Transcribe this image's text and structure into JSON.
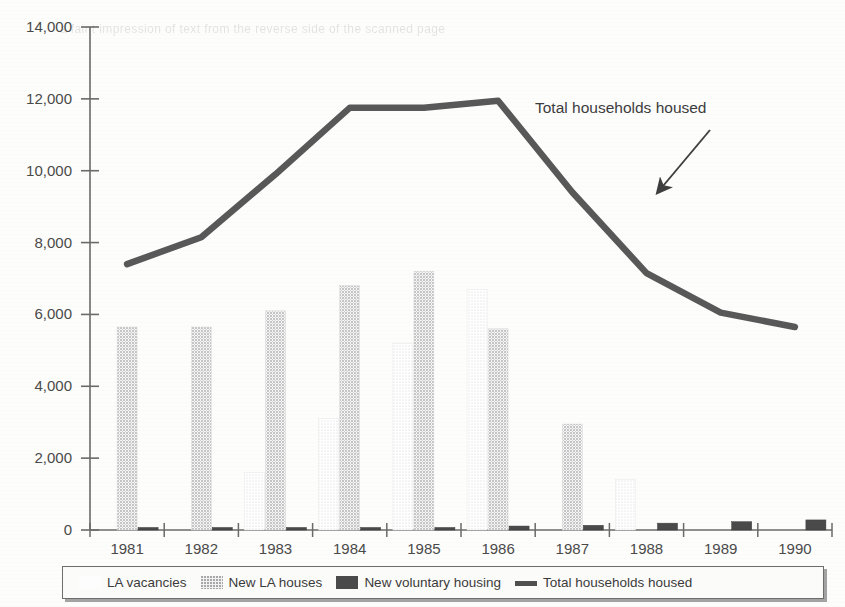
{
  "chart_data": {
    "type": "bar",
    "title": "",
    "subtitle": "",
    "xlabel": "",
    "ylabel": "",
    "ylim": [
      0,
      14000
    ],
    "ytick_values": [
      0,
      2000,
      4000,
      6000,
      8000,
      10000,
      12000,
      14000
    ],
    "ytick_labels": [
      "0",
      "2,000",
      "4,000",
      "6,000",
      "8,000",
      "10,000",
      "12,000",
      "14,000"
    ],
    "grid": false,
    "legend_position": "bottom",
    "categories": [
      "1981",
      "1982",
      "1983",
      "1984",
      "1985",
      "1986",
      "1987",
      "1988",
      "1989",
      "1990"
    ],
    "series": [
      {
        "name": "LA vacancies",
        "type": "bar",
        "color": "#fdfdfd",
        "values": [
          0,
          0,
          1600,
          3100,
          5200,
          6700,
          0,
          1400,
          0,
          0
        ]
      },
      {
        "name": "New LA houses",
        "type": "bar",
        "color": "#f0f0f0",
        "values": [
          5650,
          5650,
          6100,
          6800,
          7200,
          5600,
          2950,
          0,
          0,
          0
        ]
      },
      {
        "name": "New voluntary housing",
        "type": "bar",
        "color": "#4a4a4a",
        "values": [
          20,
          60,
          70,
          60,
          70,
          110,
          130,
          190,
          230,
          280
        ]
      },
      {
        "name": "Total households housed",
        "type": "line",
        "color": "#585858",
        "values": [
          7400,
          8150,
          9900,
          11750,
          11750,
          11950,
          9400,
          7150,
          6050,
          5650
        ]
      }
    ],
    "annotations": [
      {
        "text": "Total households housed",
        "target_series": "Total households housed",
        "arrow": "down-left"
      }
    ]
  },
  "legend": {
    "items": [
      {
        "label": "LA vacancies",
        "swatch": "dotted-light-swatch"
      },
      {
        "label": "New LA houses",
        "swatch": "dotted-grey-swatch"
      },
      {
        "label": "New voluntary housing",
        "swatch": "solid-dark-swatch"
      },
      {
        "label": "Total households housed",
        "swatch": "thick-line-swatch"
      }
    ]
  },
  "bleed_text": "a faint impression of text from the reverse side of the scanned page"
}
